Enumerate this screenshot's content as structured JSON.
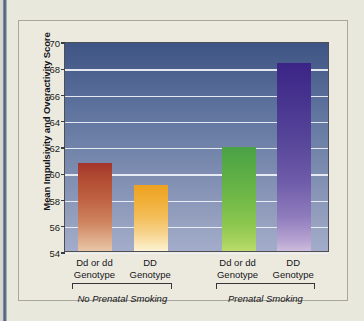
{
  "chart_data": {
    "type": "bar",
    "title": "",
    "subtitle": "",
    "xlabel": "",
    "ylabel": "Mean Impulsivity and Overactivity Score",
    "ylim": [
      54,
      70
    ],
    "ytick_step": 2,
    "yticks": [
      70,
      68,
      66,
      64,
      62,
      60,
      58,
      56,
      54
    ],
    "grid": true,
    "legend": "none",
    "categories": [
      "Dd or dd Genotype",
      "DD Genotype",
      "Dd or dd Genotype",
      "DD Genotype"
    ],
    "category_lines": [
      [
        "Dd or dd",
        "Genotype"
      ],
      [
        "DD",
        "Genotype"
      ],
      [
        "Dd or dd",
        "Genotype"
      ],
      [
        "DD",
        "Genotype"
      ]
    ],
    "values": [
      60.7,
      59.0,
      61.9,
      68.3
    ],
    "bar_colors": [
      "#b0492f",
      "#f0ad33",
      "#6fb847",
      "#554299"
    ],
    "groups": [
      {
        "label": "No Prenatal Smoking",
        "category_indices": [
          0,
          1
        ]
      },
      {
        "label": "Prenatal Smoking",
        "category_indices": [
          2,
          3
        ]
      }
    ],
    "plot_background": "blue-gradient",
    "gridline_color": "#eef1f7"
  },
  "figure": {
    "page_background": "#e9e8dd",
    "frame_background": "#eceadf",
    "frame_border_color": "#a8a79b",
    "edge_stripe_color": "#4a5f8c"
  }
}
